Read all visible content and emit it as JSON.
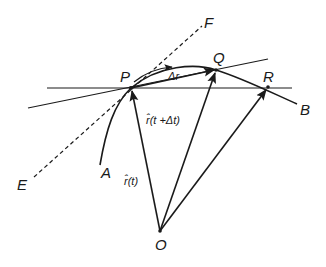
{
  "diagram": {
    "colors": {
      "stroke": "#1a1a1a",
      "background": "#ffffff"
    },
    "points": {
      "P": {
        "label": "P"
      },
      "Q": {
        "label": "Q"
      },
      "R": {
        "label": "R"
      },
      "O": {
        "label": "O"
      },
      "A": {
        "label": "A"
      },
      "B": {
        "label": "B"
      },
      "E": {
        "label": "E"
      },
      "F": {
        "label": "F"
      }
    },
    "vectors": {
      "r_t": {
        "label": "r̂(t)",
        "from": "O",
        "to": "P"
      },
      "r_t_dt": {
        "label": "r̂(t +Δt)",
        "from": "O",
        "to": "Q"
      },
      "r_R": {
        "label": "",
        "from": "O",
        "to": "R"
      },
      "delta_r": {
        "label": "Δr",
        "from": "P",
        "to": "Q"
      }
    },
    "lines": {
      "tangent": {
        "label": "EF",
        "style": "dashed"
      },
      "secant_PQ": {
        "label": "PQ",
        "style": "solid"
      },
      "secant_PR": {
        "label": "PR",
        "style": "solid"
      },
      "curve": {
        "label": "AB",
        "style": "solid"
      }
    }
  }
}
